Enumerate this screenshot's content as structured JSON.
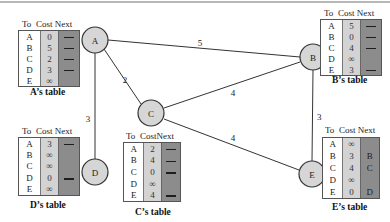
{
  "diagram": {
    "type": "distance-vector-routing",
    "header_labels": {
      "to": "To",
      "cost": "Cost",
      "next": "Next"
    },
    "nodes": [
      {
        "id": "A",
        "label": "A"
      },
      {
        "id": "B",
        "label": "B"
      },
      {
        "id": "C",
        "label": "C"
      },
      {
        "id": "D",
        "label": "D"
      },
      {
        "id": "E",
        "label": "E"
      }
    ],
    "edges": [
      {
        "from": "A",
        "to": "B",
        "cost": "5"
      },
      {
        "from": "A",
        "to": "C",
        "cost": "2"
      },
      {
        "from": "A",
        "to": "D",
        "cost": "3"
      },
      {
        "from": "C",
        "to": "B",
        "cost": "4"
      },
      {
        "from": "C",
        "to": "E",
        "cost": "4"
      },
      {
        "from": "B",
        "to": "E",
        "cost": "3"
      }
    ],
    "tables": {
      "A": {
        "caption": "A’s table",
        "rows": [
          {
            "to": "A",
            "cost": "0",
            "next": "—"
          },
          {
            "to": "B",
            "cost": "5",
            "next": "—"
          },
          {
            "to": "C",
            "cost": "2",
            "next": "—"
          },
          {
            "to": "D",
            "cost": "3",
            "next": "—"
          },
          {
            "to": "E",
            "cost": "∞",
            "next": ""
          }
        ]
      },
      "B": {
        "caption": "B’s table",
        "rows": [
          {
            "to": "A",
            "cost": "5",
            "next": "—"
          },
          {
            "to": "B",
            "cost": "0",
            "next": "—"
          },
          {
            "to": "C",
            "cost": "4",
            "next": "—"
          },
          {
            "to": "D",
            "cost": "∞",
            "next": ""
          },
          {
            "to": "E",
            "cost": "3",
            "next": "—"
          }
        ]
      },
      "C": {
        "caption": "C’s table",
        "rows": [
          {
            "to": "A",
            "cost": "2",
            "next": "—"
          },
          {
            "to": "B",
            "cost": "4",
            "next": "—"
          },
          {
            "to": "C",
            "cost": "0",
            "next": "—"
          },
          {
            "to": "D",
            "cost": "∞",
            "next": ""
          },
          {
            "to": "E",
            "cost": "4",
            "next": "—"
          }
        ]
      },
      "D": {
        "caption": "D’s table",
        "rows": [
          {
            "to": "A",
            "cost": "3",
            "next": "—"
          },
          {
            "to": "B",
            "cost": "∞",
            "next": ""
          },
          {
            "to": "C",
            "cost": "∞",
            "next": ""
          },
          {
            "to": "D",
            "cost": "0",
            "next": "—"
          },
          {
            "to": "E",
            "cost": "∞",
            "next": ""
          }
        ]
      },
      "E": {
        "caption": "E’s table",
        "rows": [
          {
            "to": "A",
            "cost": "∞",
            "next": ""
          },
          {
            "to": "B",
            "cost": "3",
            "next": "B"
          },
          {
            "to": "C",
            "cost": "4",
            "next": "C"
          },
          {
            "to": "D",
            "cost": "∞",
            "next": ""
          },
          {
            "to": "E",
            "cost": "0",
            "next": "D"
          }
        ]
      }
    },
    "colors": {
      "to_column": "#ffffff",
      "cost_column": "#d3d3d3",
      "next_column": "#8c8c8c",
      "node_fill": "#d6d6d6",
      "edge": "#333333"
    }
  }
}
